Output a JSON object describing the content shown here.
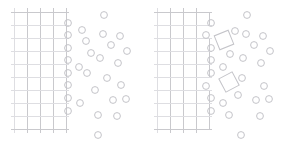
{
  "figure": {
    "background_color": "#ffffff",
    "width": 285,
    "height": 150,
    "panel_count": 2
  },
  "style": {
    "lattice_stroke": "#c9c9cd",
    "lattice_stroke_faint": "#dedee2",
    "particle_stroke": "#c4c4c9",
    "particle_fill": "none",
    "stroke_width": 1,
    "particle_radius": 3.4,
    "cell_size": 13
  },
  "panels": [
    {
      "id": "panel-left",
      "name": "intact-crystal-panel",
      "label": "",
      "lattice": {
        "name": "crystal-lattice-intact",
        "x_origin": 14,
        "y_origin": 12,
        "cell_size": 13,
        "columns": 4,
        "rows": 9,
        "vertical_lines_x": [
          14,
          27,
          40,
          53,
          66
        ],
        "horizontal_lines_y": [
          12,
          25,
          38,
          51,
          64,
          77,
          90,
          103,
          116,
          129
        ],
        "edge_profile": "straight",
        "detached_cells": []
      },
      "particles": [
        {
          "cx": 68,
          "cy": 23
        },
        {
          "cx": 68,
          "cy": 35
        },
        {
          "cx": 68,
          "cy": 48
        },
        {
          "cx": 68,
          "cy": 60
        },
        {
          "cx": 68,
          "cy": 73
        },
        {
          "cx": 68,
          "cy": 85
        },
        {
          "cx": 68,
          "cy": 98
        },
        {
          "cx": 68,
          "cy": 111
        },
        {
          "cx": 82,
          "cy": 30
        },
        {
          "cx": 79,
          "cy": 67
        },
        {
          "cx": 80,
          "cy": 103
        },
        {
          "cx": 91,
          "cy": 53
        },
        {
          "cx": 87,
          "cy": 73
        },
        {
          "cx": 86,
          "cy": 41
        },
        {
          "cx": 95,
          "cy": 90
        },
        {
          "cx": 98,
          "cy": 115
        },
        {
          "cx": 104,
          "cy": 15
        },
        {
          "cx": 103,
          "cy": 34
        },
        {
          "cx": 100,
          "cy": 58
        },
        {
          "cx": 107,
          "cy": 78
        },
        {
          "cx": 111,
          "cy": 45
        },
        {
          "cx": 113,
          "cy": 100
        },
        {
          "cx": 117,
          "cy": 116
        },
        {
          "cx": 120,
          "cy": 36
        },
        {
          "cx": 118,
          "cy": 63
        },
        {
          "cx": 121,
          "cy": 85
        },
        {
          "cx": 127,
          "cy": 51
        },
        {
          "cx": 126,
          "cy": 99
        },
        {
          "cx": 98,
          "cy": 135
        }
      ],
      "particle_count": 29
    },
    {
      "id": "panel-right",
      "name": "dissolving-crystal-panel",
      "label": "",
      "lattice": {
        "name": "crystal-lattice-dissolving",
        "x_origin": 14,
        "y_origin": 12,
        "cell_size": 13,
        "columns": 4,
        "rows": 9,
        "vertical_lines_x": [
          14,
          27,
          40,
          53,
          66
        ],
        "horizontal_lines_y": [
          12,
          25,
          38,
          51,
          64,
          77,
          90,
          103,
          116,
          129
        ],
        "edge_profile": "stepped",
        "vacancy_cells": [
          {
            "col": 4,
            "row": 2
          },
          {
            "col": 4,
            "row": 6
          }
        ]
      },
      "detached_cells": [
        {
          "name": "detached-unit-cell-upper",
          "cx": 81,
          "cy": 40,
          "size": 15,
          "rotation_deg": -22
        },
        {
          "name": "detached-unit-cell-lower",
          "cx": 86,
          "cy": 82,
          "size": 15,
          "rotation_deg": -28
        }
      ],
      "particles": [
        {
          "cx": 68,
          "cy": 23
        },
        {
          "cx": 68,
          "cy": 48
        },
        {
          "cx": 68,
          "cy": 60
        },
        {
          "cx": 68,
          "cy": 73
        },
        {
          "cx": 68,
          "cy": 98
        },
        {
          "cx": 68,
          "cy": 111
        },
        {
          "cx": 63,
          "cy": 35
        },
        {
          "cx": 63,
          "cy": 86
        },
        {
          "cx": 92,
          "cy": 31
        },
        {
          "cx": 80,
          "cy": 67
        },
        {
          "cx": 80,
          "cy": 103
        },
        {
          "cx": 95,
          "cy": 95
        },
        {
          "cx": 87,
          "cy": 54
        },
        {
          "cx": 86,
          "cy": 115
        },
        {
          "cx": 104,
          "cy": 15
        },
        {
          "cx": 103,
          "cy": 34
        },
        {
          "cx": 100,
          "cy": 58
        },
        {
          "cx": 99,
          "cy": 78
        },
        {
          "cx": 111,
          "cy": 45
        },
        {
          "cx": 113,
          "cy": 100
        },
        {
          "cx": 117,
          "cy": 116
        },
        {
          "cx": 120,
          "cy": 36
        },
        {
          "cx": 118,
          "cy": 63
        },
        {
          "cx": 121,
          "cy": 86
        },
        {
          "cx": 127,
          "cy": 51
        },
        {
          "cx": 126,
          "cy": 99
        },
        {
          "cx": 98,
          "cy": 135
        }
      ],
      "particle_count": 27
    }
  ]
}
